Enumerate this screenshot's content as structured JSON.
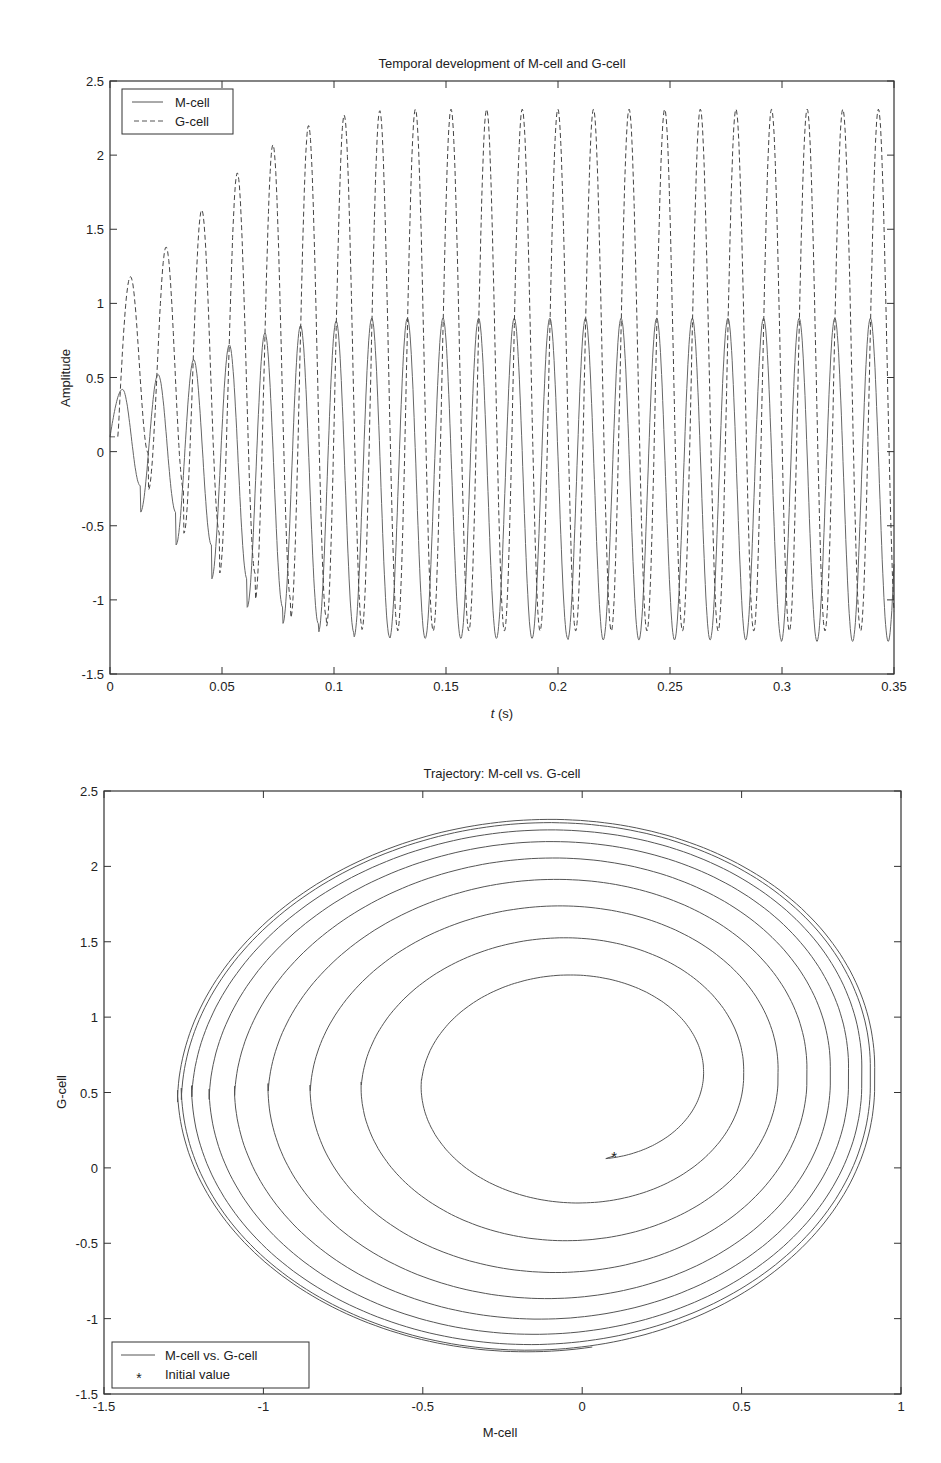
{
  "chart_data": [
    {
      "type": "line",
      "title": "Temporal development of M-cell and G-cell",
      "xlabel_italic": "t",
      "xlabel_rest": " (s)",
      "ylabel": "Amplitude",
      "xlim": [
        0,
        0.35
      ],
      "ylim": [
        -1.5,
        2.5
      ],
      "xticks": [
        0,
        0.05,
        0.1,
        0.15,
        0.2,
        0.25,
        0.3,
        0.35
      ],
      "xtick_labels": [
        "0",
        "0.05",
        "0.1",
        "0.15",
        "0.2",
        "0.25",
        "0.3",
        "0.35"
      ],
      "yticks": [
        -1.5,
        -1,
        -0.5,
        0,
        0.5,
        1,
        1.5,
        2,
        2.5
      ],
      "ytick_labels": [
        "-1.5",
        "-1",
        "-0.5",
        "0",
        "0.5",
        "1",
        "1.5",
        "2",
        "2.5"
      ],
      "grid": false,
      "legend_position": "upper-left",
      "legend": [
        {
          "label": "M-cell",
          "style": "solid"
        },
        {
          "label": "G-cell",
          "style": "dashed"
        }
      ],
      "series": [
        {
          "name": "M-cell",
          "style": "solid",
          "start_value": 0.1,
          "period_s": 0.0159,
          "peaks": [
            0.42,
            0.52,
            0.62,
            0.72,
            0.8,
            0.85,
            0.88,
            0.9,
            0.9,
            0.9,
            0.9,
            0.9,
            0.9,
            0.9,
            0.9,
            0.9,
            0.9,
            0.9,
            0.9,
            0.9,
            0.9,
            0.9
          ],
          "troughs": [
            -0.23,
            -0.41,
            -0.63,
            -0.86,
            -1.05,
            -1.16,
            -1.22,
            -1.25,
            -1.26,
            -1.26,
            -1.26,
            -1.26,
            -1.26,
            -1.27,
            -1.27,
            -1.27,
            -1.27,
            -1.27,
            -1.27,
            -1.28,
            -1.28,
            -1.28
          ]
        },
        {
          "name": "G-cell",
          "style": "dashed",
          "start_value": 0.1,
          "period_s": 0.0159,
          "peaks": [
            1.18,
            1.38,
            1.63,
            1.88,
            2.07,
            2.2,
            2.27,
            2.3,
            2.31,
            2.31,
            2.31,
            2.31,
            2.31,
            2.31,
            2.31,
            2.31,
            2.31,
            2.31,
            2.31,
            2.31,
            2.31,
            2.31
          ],
          "troughs": [
            -0.01,
            -0.26,
            -0.55,
            -0.82,
            -1.0,
            -1.12,
            -1.18,
            -1.2,
            -1.21,
            -1.21,
            -1.21,
            -1.21,
            -1.21,
            -1.21,
            -1.21,
            -1.21,
            -1.21,
            -1.21,
            -1.21,
            -1.21,
            -1.21,
            -1.21
          ]
        }
      ]
    },
    {
      "type": "line",
      "title": "Trajectory: M-cell vs. G-cell",
      "xlabel": "M-cell",
      "ylabel": "G-cell",
      "xlim": [
        -1.5,
        1
      ],
      "ylim": [
        -1.5,
        2.5
      ],
      "xticks": [
        -1.5,
        -1,
        -0.5,
        0,
        0.5,
        1
      ],
      "xtick_labels": [
        "-1.5",
        "-1",
        "-0.5",
        "0",
        "0.5",
        "1"
      ],
      "yticks": [
        -1.5,
        -1,
        -0.5,
        0,
        0.5,
        1,
        1.5,
        2,
        2.5
      ],
      "ytick_labels": [
        "-1.5",
        "-1",
        "-0.5",
        "0",
        "0.5",
        "1",
        "1.5",
        "2",
        "2.5"
      ],
      "grid": false,
      "legend_position": "lower-left",
      "legend": [
        {
          "label": "M-cell vs. G-cell",
          "style": "solid"
        },
        {
          "label": "Initial value",
          "style": "asterisk"
        }
      ],
      "initial_value": {
        "x": 0.1,
        "y": 0.08
      },
      "spiral_center": {
        "x": 0.0,
        "y": 0.6
      },
      "limit_cycle": {
        "x_min": -1.27,
        "x_max": 0.92,
        "y_min": -1.22,
        "y_max": 2.31
      },
      "num_loops": 9
    }
  ]
}
